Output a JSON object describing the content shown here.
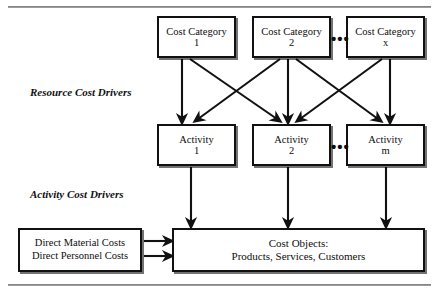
{
  "figure": {
    "background": "#ffffff",
    "line_color": "#111111",
    "rule_color": "#6f6f6f"
  },
  "captions": {
    "resource_cost_drivers": "Resource Cost Drivers",
    "activity_cost_drivers": "Activity Cost Drivers"
  },
  "cost_categories": [
    {
      "line1": "Cost Category",
      "line2": "1"
    },
    {
      "line1": "Cost Category",
      "line2": "2"
    },
    {
      "line1": "Cost Category",
      "line2": "x"
    }
  ],
  "activities": [
    {
      "line1": "Activity",
      "line2": "1"
    },
    {
      "line1": "Activity",
      "line2": "2"
    },
    {
      "line1": "Activity",
      "line2": "m"
    }
  ],
  "ellipsis": {
    "categories": "•••",
    "activities": "•••"
  },
  "direct_costs": {
    "line1": "Direct Material Costs",
    "line2": "Direct Personnel Costs"
  },
  "cost_objects": {
    "line1": "Cost Objects:",
    "line2": "Products, Services, Customers"
  }
}
